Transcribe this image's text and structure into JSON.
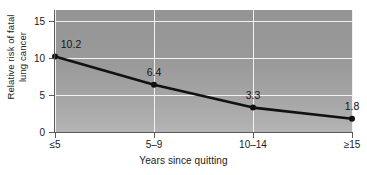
{
  "chart_data": {
    "type": "line",
    "title": "",
    "xlabel": "Years since quitting",
    "ylabel": "Relative risk of fatal\nlung cancer",
    "categories": [
      "≤5",
      "5–9",
      "10–14",
      "≥15"
    ],
    "values": [
      10.2,
      6.4,
      3.3,
      1.8
    ],
    "point_labels": [
      "10.2",
      "6.4",
      "3.3",
      "1.8"
    ],
    "ylim": [
      0,
      16.5
    ],
    "yticks": [
      0,
      5,
      10,
      15
    ],
    "ytick_labels": [
      "0",
      "5",
      "10",
      "15"
    ],
    "grid": "both",
    "legend": "none",
    "series_color": "#111111",
    "plot_background": "#9a9a9a",
    "gridline_color": "#f2f2f2",
    "axis_color": "#5a5a5a"
  },
  "axes": {
    "y_title": "Relative risk of fatal\nlung cancer",
    "x_title": "Years since quitting"
  }
}
